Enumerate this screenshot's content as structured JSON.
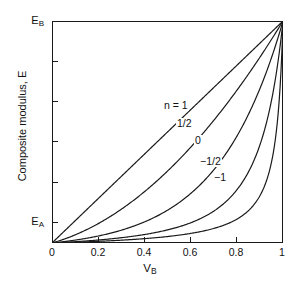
{
  "figure": {
    "background_color": "#ffffff",
    "line_color": "#1a1a1a",
    "width": 300,
    "height": 296
  },
  "axes": {
    "x": {
      "label": "V",
      "label_sub": "B",
      "ticklabels": [
        "0",
        "0.2",
        "0.4",
        "0.6",
        "0.8",
        "1"
      ],
      "tickvalues": [
        0,
        0.2,
        0.4,
        0.6,
        0.8,
        1
      ],
      "range": [
        0,
        1
      ]
    },
    "y": {
      "label": "Composite modulus, E",
      "bottom_label": "E",
      "bottom_label_sub": "A",
      "top_label": "E",
      "top_label_sub": "B",
      "minor_tick_count": 5,
      "range": [
        0,
        1
      ]
    }
  },
  "annotations": [
    {
      "text": "n = 1",
      "x_px": 163,
      "y_px": 100
    },
    {
      "text": "1/2",
      "x_px": 176,
      "y_px": 118
    },
    {
      "text": "0",
      "x_px": 194,
      "y_px": 135
    },
    {
      "text": "−1/2",
      "x_px": 199,
      "y_px": 156
    },
    {
      "text": "−1",
      "x_px": 213,
      "y_px": 172
    }
  ],
  "chart_data": {
    "type": "line",
    "title": "",
    "xlabel": "V_B",
    "ylabel": "Composite modulus, E",
    "xlim": [
      0,
      1
    ],
    "ylim": [
      0,
      1
    ],
    "grid": false,
    "legend": "inline-curve-labels",
    "x": [
      0,
      0.05,
      0.1,
      0.15,
      0.2,
      0.25,
      0.3,
      0.35,
      0.4,
      0.45,
      0.5,
      0.55,
      0.6,
      0.65,
      0.7,
      0.75,
      0.8,
      0.85,
      0.9,
      0.95,
      1
    ],
    "series": [
      {
        "name": "n = 1",
        "exponent": 1,
        "values": [
          0,
          0.05,
          0.1,
          0.15,
          0.2,
          0.25,
          0.3,
          0.35,
          0.4,
          0.45,
          0.5,
          0.55,
          0.6,
          0.65,
          0.7,
          0.75,
          0.8,
          0.85,
          0.9,
          0.95,
          1
        ]
      },
      {
        "name": "1/2",
        "exponent": 0.5,
        "values": [
          0,
          0.0316,
          0.0662,
          0.1033,
          0.1428,
          0.1846,
          0.2287,
          0.2751,
          0.3237,
          0.3745,
          0.4275,
          0.4827,
          0.54,
          0.5995,
          0.6611,
          0.7248,
          0.7906,
          0.8585,
          0.9285,
          1.0,
          1
        ]
      },
      {
        "name": "0",
        "exponent": 0,
        "values": [
          0,
          0.0138,
          0.0263,
          0.0398,
          0.0556,
          0.0743,
          0.0968,
          0.1238,
          0.1561,
          0.1946,
          0.2402,
          0.2938,
          0.3565,
          0.4292,
          0.513,
          0.6091,
          0.7186,
          0.8428,
          0.983,
          1.0,
          1
        ]
      },
      {
        "name": "−1/2",
        "exponent": -0.5,
        "values": [
          0,
          0.0086,
          0.0172,
          0.0262,
          0.0357,
          0.0461,
          0.0577,
          0.0709,
          0.0862,
          0.1044,
          0.1264,
          0.1535,
          0.1878,
          0.2325,
          0.2927,
          0.3774,
          0.5029,
          0.7029,
          1.0,
          1.0,
          1
        ]
      },
      {
        "name": "−1",
        "exponent": -1,
        "values": [
          0,
          0.0062,
          0.0126,
          0.0193,
          0.0263,
          0.0337,
          0.0417,
          0.0502,
          0.0595,
          0.0698,
          0.0812,
          0.0941,
          0.1091,
          0.127,
          0.1489,
          0.177,
          0.2149,
          0.2704,
          0.3644,
          0.5745,
          1
        ]
      }
    ]
  }
}
